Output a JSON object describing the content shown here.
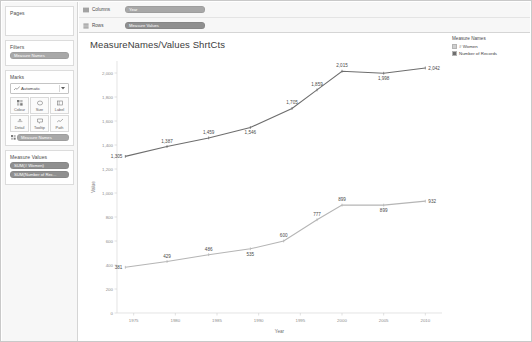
{
  "sidebar": {
    "pages": {
      "title": "Pages"
    },
    "filters": {
      "title": "Filters",
      "pill": "Measure Names"
    },
    "marks": {
      "title": "Marks",
      "type_icon": "line-chart-icon",
      "type_label": "Automatic",
      "dropdown_icon": "chevron-down-icon",
      "buttons": [
        {
          "label": "Colour",
          "icon": "colour-icon"
        },
        {
          "label": "Size",
          "icon": "size-icon"
        },
        {
          "label": "Label",
          "icon": "label-icon"
        },
        {
          "label": "Detail",
          "icon": "detail-icon"
        },
        {
          "label": "Tooltip",
          "icon": "tooltip-icon"
        },
        {
          "label": "Path",
          "icon": "path-icon"
        }
      ],
      "encoding_pill": "Measure Names",
      "encoding_icon": "colour-icon"
    },
    "measure_values": {
      "title": "Measure Values",
      "pills": [
        "SUM(# Women)",
        "SUM(Number of Rec..."
      ]
    }
  },
  "shelves": [
    {
      "icon": "columns-icon",
      "label": "Columns",
      "pill": "Year"
    },
    {
      "icon": "rows-icon",
      "label": "Rows",
      "pill": "Measure Values"
    }
  ],
  "canvas": {
    "title": "MeasureNames/Values ShrtCts"
  },
  "legend": {
    "title": "Measure Names",
    "items": [
      {
        "label": "# Women",
        "colour": "#cfcfcf"
      },
      {
        "label": "Number of Records",
        "colour": "#6e6e6e"
      }
    ]
  },
  "chart_data": {
    "type": "line",
    "title": "MeasureNames/Values ShrtCts",
    "xlabel": "Year",
    "ylabel": "Value",
    "x": [
      1975,
      1980,
      1985,
      1990,
      1995,
      2000,
      2005,
      2010
    ],
    "xticks": [
      "1975",
      "1980",
      "1985",
      "1990",
      "1995",
      "2000",
      "2005",
      "2010"
    ],
    "yticks": [
      "0",
      "200",
      "400",
      "600",
      "800",
      "1000",
      "1200",
      "1400",
      "1600",
      "1800",
      "2000"
    ],
    "ylim": [
      0,
      2100
    ],
    "xlim": [
      1973,
      2012
    ],
    "grid": false,
    "legend_position": "right",
    "series": [
      {
        "name": "Number of Records",
        "colour": "#6e6e6e",
        "points": [
          {
            "x": 1974,
            "y": 1305,
            "label": "1,305"
          },
          {
            "x": 1979,
            "y": 1387,
            "label": "1,387"
          },
          {
            "x": 1984,
            "y": 1459,
            "label": "1,459"
          },
          {
            "x": 1989,
            "y": 1546,
            "label": "1,546"
          },
          {
            "x": 1994,
            "y": 1705,
            "label": "1,705"
          },
          {
            "x": 1997,
            "y": 1859,
            "label": "1,859"
          },
          {
            "x": 2000,
            "y": 2015,
            "label": "2,015"
          },
          {
            "x": 2005,
            "y": 1998,
            "label": "1,998"
          },
          {
            "x": 2010,
            "y": 2042,
            "label": "2,042"
          }
        ]
      },
      {
        "name": "# Women",
        "colour": "#b5b5b5",
        "points": [
          {
            "x": 1974,
            "y": 381,
            "label": "381"
          },
          {
            "x": 1979,
            "y": 429,
            "label": "429"
          },
          {
            "x": 1984,
            "y": 486,
            "label": "486"
          },
          {
            "x": 1989,
            "y": 535,
            "label": "535"
          },
          {
            "x": 1993,
            "y": 600,
            "label": "600"
          },
          {
            "x": 1997,
            "y": 777,
            "label": "777"
          },
          {
            "x": 2000,
            "y": 899,
            "label": "899"
          },
          {
            "x": 2005,
            "y": 899,
            "label": "899"
          },
          {
            "x": 2010,
            "y": 932,
            "label": "932"
          }
        ]
      }
    ]
  }
}
